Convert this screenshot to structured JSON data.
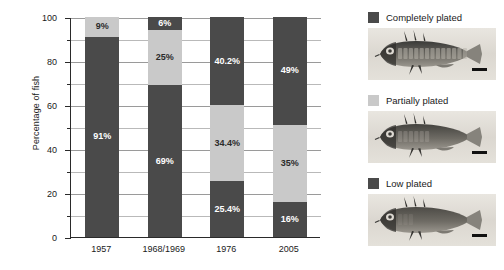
{
  "chart_data": {
    "type": "bar",
    "subtype": "stacked-bar-100",
    "title": "",
    "xlabel": "",
    "ylabel": "Percentage of fish",
    "ylim": [
      0,
      100
    ],
    "yticks": [
      0,
      20,
      40,
      60,
      80,
      100
    ],
    "ytick_labels": [
      "0",
      "20",
      "40",
      "60",
      "80",
      "100"
    ],
    "yminor_ticks": [
      10,
      30,
      50,
      70,
      90
    ],
    "grid": "horizontal",
    "legend_position": "right",
    "categories": [
      "1957",
      "1968/1969",
      "1976",
      "2005"
    ],
    "series": [
      {
        "name": "Completely plated",
        "color": "#4a4a4a",
        "values": [
          91,
          69,
          40.2,
          49
        ],
        "labels": [
          "91%",
          "69%",
          "40.2%",
          "49%"
        ]
      },
      {
        "name": "Partially plated",
        "color": "#c9c9c9",
        "values": [
          9,
          25,
          34.4,
          35
        ],
        "labels": [
          "9%",
          "25%",
          "34.4%",
          "35%"
        ]
      },
      {
        "name": "Low plated",
        "color": "#4a4a4a",
        "values": [
          0,
          6,
          25.4,
          16
        ],
        "labels": [
          "",
          "6%",
          "25.4%",
          "16%"
        ]
      }
    ],
    "bars": [
      {
        "category": "1957",
        "segments": [
          {
            "series": "Completely plated",
            "value": 91,
            "label": "91%",
            "shade": "dark",
            "from": 0,
            "to": 91
          },
          {
            "series": "Partially plated",
            "value": 9,
            "label": "9%",
            "shade": "light",
            "from": 91,
            "to": 100
          }
        ]
      },
      {
        "category": "1968/1969",
        "segments": [
          {
            "series": "Completely plated",
            "value": 69,
            "label": "69%",
            "shade": "dark",
            "from": 0,
            "to": 69
          },
          {
            "series": "Partially plated",
            "value": 25,
            "label": "25%",
            "shade": "light",
            "from": 69,
            "to": 94
          },
          {
            "series": "Low plated",
            "value": 6,
            "label": "6%",
            "shade": "dark",
            "from": 94,
            "to": 100
          }
        ]
      },
      {
        "category": "1976",
        "segments": [
          {
            "series": "Low plated",
            "value": 25.4,
            "label": "25.4%",
            "shade": "dark",
            "from": 0,
            "to": 25.4
          },
          {
            "series": "Partially plated",
            "value": 34.4,
            "label": "34.4%",
            "shade": "light",
            "from": 25.4,
            "to": 59.8
          },
          {
            "series": "Completely plated",
            "value": 40.2,
            "label": "40.2%",
            "shade": "dark",
            "from": 59.8,
            "to": 100
          }
        ]
      },
      {
        "category": "2005",
        "segments": [
          {
            "series": "Low plated",
            "value": 16,
            "label": "16%",
            "shade": "dark",
            "from": 0,
            "to": 16
          },
          {
            "series": "Partially plated",
            "value": 35,
            "label": "35%",
            "shade": "light",
            "from": 16,
            "to": 51
          },
          {
            "series": "Completely plated",
            "value": 49,
            "label": "49%",
            "shade": "dark",
            "from": 51,
            "to": 100
          }
        ]
      }
    ]
  },
  "legend": {
    "entries": [
      {
        "label": "Completely plated",
        "swatch_color": "#4a4a4a",
        "photo": "stickleback-completely-plated"
      },
      {
        "label": "Partially plated",
        "swatch_color": "#c9c9c9",
        "photo": "stickleback-partially-plated"
      },
      {
        "label": "Low plated",
        "swatch_color": "#4a4a4a",
        "photo": "stickleback-low-plated"
      }
    ]
  },
  "colors": {
    "dark_plate": "#4a4a4a",
    "light_plate": "#c9c9c9",
    "axis": "#2a2a2a",
    "gridline": "#b9b9b9",
    "background": "#ffffff"
  }
}
